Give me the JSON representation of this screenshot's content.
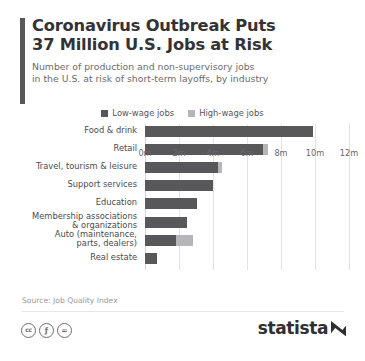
{
  "header": {
    "title_line1": "Coronavirus Outbreak Puts",
    "title_line2": "37 Million U.S. Jobs at Risk",
    "subtitle_line1": "Number of production and non-supervisory jobs",
    "subtitle_line2": "in the U.S. at risk of short-term layoffs, by industry"
  },
  "legend": {
    "items": [
      {
        "label": "Low-wage jobs",
        "color": "#58585a"
      },
      {
        "label": "High-wage jobs",
        "color": "#b6b6b8"
      }
    ]
  },
  "source": {
    "text": "Source: Job Quality Index"
  },
  "footer": {
    "cc_badges": [
      {
        "name": "creative-commons-icon",
        "glyph": "cc"
      },
      {
        "name": "cc-by-attribution-icon",
        "glyph": "ƒ"
      },
      {
        "name": "cc-nd-noderivatives-icon",
        "glyph": "="
      }
    ],
    "brand": "statista"
  },
  "chart_data": {
    "type": "bar",
    "orientation": "horizontal",
    "stacked": true,
    "title": "Coronavirus Outbreak Puts 37 Million U.S. Jobs at Risk",
    "subtitle": "Number of production and non-supervisory jobs in the U.S. at risk of short-term layoffs, by industry",
    "xlabel": "",
    "ylabel": "",
    "xlim": [
      0,
      12
    ],
    "xticks": [
      0,
      2,
      4,
      6,
      8,
      10,
      12
    ],
    "xticklabels": [
      "0m",
      "2m",
      "4m",
      "6m",
      "8m",
      "10m",
      "12m"
    ],
    "grid": true,
    "legend_position": "top-center",
    "unit": "millions of jobs",
    "categories": [
      "Food & drink",
      "Retail",
      "Travel, tourism & leisure",
      "Support services",
      "Education",
      "Membership associations & organizations",
      "Auto (maintenance, parts, dealers)",
      "Real estate"
    ],
    "category_lines": [
      [
        "Food & drink"
      ],
      [
        "Retail"
      ],
      [
        "Travel, tourism & leisure"
      ],
      [
        "Support services"
      ],
      [
        "Education"
      ],
      [
        "Membership associations",
        "& organizations"
      ],
      [
        "Auto (maintenance,",
        "parts, dealers)"
      ],
      [
        "Real estate"
      ]
    ],
    "series": [
      {
        "name": "Low-wage jobs",
        "color": "#58585a",
        "values": [
          9.9,
          6.95,
          4.3,
          4.0,
          3.05,
          2.45,
          1.8,
          0.7
        ]
      },
      {
        "name": "High-wage jobs",
        "color": "#b6b6b8",
        "values": [
          0.0,
          0.3,
          0.25,
          0.0,
          0.0,
          0.0,
          1.0,
          0.0
        ]
      }
    ]
  }
}
